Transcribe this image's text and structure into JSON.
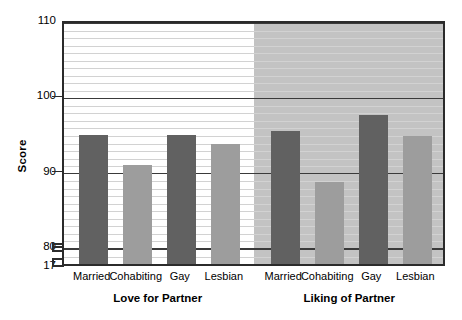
{
  "chart_data": {
    "type": "bar",
    "title": "",
    "xlabel": "",
    "ylabel": "Score",
    "ylim": [
      80,
      110
    ],
    "y_axis_broken": true,
    "y_axis_base_label": "17",
    "grid": true,
    "legend_position": "none",
    "y_ticks": [
      {
        "label": "110",
        "value": 110
      },
      {
        "label": "100",
        "value": 100
      },
      {
        "label": "90",
        "value": 90
      },
      {
        "label": "80",
        "value": 80
      },
      {
        "label": "17",
        "value": 17
      }
    ],
    "groups": [
      {
        "title": "Love for Partner",
        "categories": [
          "Married",
          "Cohabiting",
          "Gay",
          "Lesbian"
        ],
        "values": [
          95.1,
          91.2,
          95.1,
          94.0
        ],
        "shades": [
          "dark",
          "light",
          "dark",
          "light"
        ]
      },
      {
        "title": "Liking of Partner",
        "categories": [
          "Married",
          "Cohabiting",
          "Gay",
          "Lesbian"
        ],
        "values": [
          95.6,
          88.9,
          97.8,
          95.0
        ],
        "shades": [
          "dark",
          "light",
          "dark",
          "light"
        ]
      }
    ],
    "colors": {
      "bar_dark": "#616161",
      "bar_light": "#9d9d9d",
      "panel_left_bg": "#ffffff",
      "panel_right_bg": "#c3c3c3",
      "gridline_minor": "#d2d2d2",
      "gridline_major": "#3a3a3a",
      "axis": "#2b2b2b"
    }
  }
}
